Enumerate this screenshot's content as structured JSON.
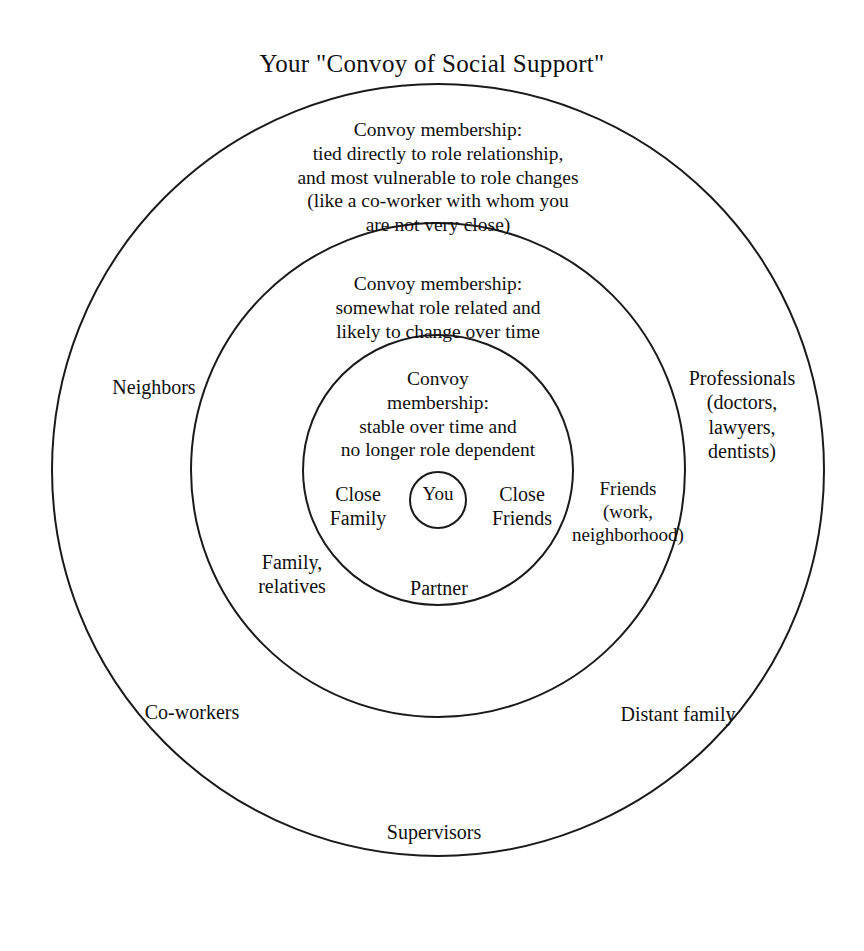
{
  "title": "Your \"Convoy of Social Support\"",
  "diagram": {
    "type": "concentric-circles",
    "colors": {
      "stroke": "#1a1a1a",
      "background": "#ffffff",
      "text": "#101010"
    },
    "rings": {
      "outer": {
        "description": "Convoy membership:\ntied directly to role relationship,\nand most vulnerable to role changes\n(like a co-worker with whom you\nare not very close)",
        "members": {
          "neighbors": "Neighbors",
          "professionals": "Professionals\n(doctors,\nlawyers,\ndentists)",
          "co_workers": "Co-workers",
          "distant_family": "Distant family",
          "supervisors": "Supervisors"
        }
      },
      "middle": {
        "description": "Convoy membership:\nsomewhat role related and\nlikely to change over time",
        "members": {
          "family_relatives": "Family,\nrelatives",
          "friends": "Friends\n(work,\nneighborhood)"
        }
      },
      "inner": {
        "description": "Convoy\nmembership:\nstable over time and\nno longer role dependent",
        "members": {
          "close_family": "Close\nFamily",
          "close_friends": "Close\nFriends",
          "partner": "Partner"
        }
      },
      "center": {
        "label": "You"
      }
    }
  }
}
